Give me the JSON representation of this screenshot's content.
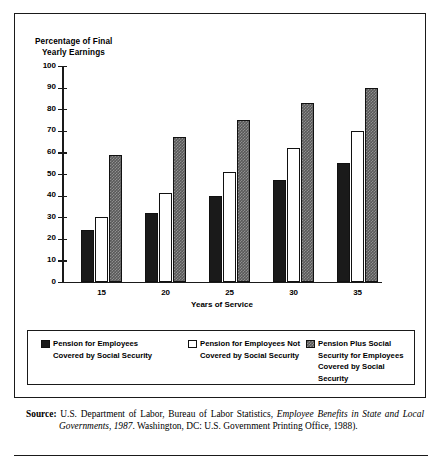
{
  "figure": {
    "y_axis_title": "Percentage of Final\n   Yearly Earnings",
    "x_axis_title": "Years of Service"
  },
  "legend": {
    "items": [
      {
        "label": "Pension for Employees\nCovered by Social Security",
        "swatch": "black-square-icon",
        "color": "#1a1a1a"
      },
      {
        "label": "Pension for Employees Not\nCovered by Social Security",
        "swatch": "white-square-icon",
        "color": "#ffffff"
      },
      {
        "label": "Pension Plus Social\nSecurity for Employees\nCovered by Social Security",
        "swatch": "gray-hatched-square-icon",
        "color": "#595959"
      }
    ]
  },
  "source": {
    "prefix": "Source:",
    "text_1": "U.S. Department of Labor, Bureau of Labor Statistics, ",
    "italic_1": "Employee Benefits in State and Local Governments, 1987",
    "text_2": ". Washington, DC: U.S. Government Printing Office, 1988)."
  },
  "chart_data": {
    "type": "bar",
    "title": "",
    "xlabel": "Years of Service",
    "ylabel": "Percentage of Final Yearly Earnings",
    "categories": [
      "15",
      "20",
      "25",
      "30",
      "35"
    ],
    "ylim": [
      0,
      100
    ],
    "yticks": [
      0,
      10,
      20,
      30,
      40,
      50,
      60,
      70,
      80,
      90,
      100
    ],
    "grid": false,
    "legend_position": "below-plot",
    "series": [
      {
        "name": "Pension for Employees Covered by Social Security",
        "color": "#1a1a1a",
        "values": [
          24,
          32,
          40,
          47,
          55
        ]
      },
      {
        "name": "Pension for Employees Not Covered by Social Security",
        "color": "#ffffff",
        "values": [
          30,
          41,
          51,
          62,
          70
        ]
      },
      {
        "name": "Pension Plus Social Security for Employees Covered by Social Security",
        "color": "#595959",
        "values": [
          59,
          67,
          75,
          83,
          90
        ]
      }
    ]
  }
}
